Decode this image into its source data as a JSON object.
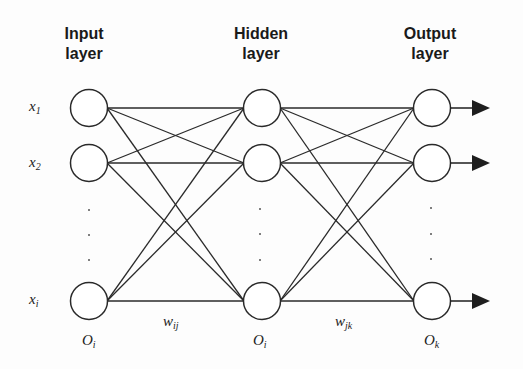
{
  "diagram": {
    "type": "feedforward-neural-network",
    "layers": [
      {
        "id": "input",
        "title_line1": "Input",
        "title_line2": "layer",
        "node_label": "O",
        "node_label_sub": "i",
        "inputs": [
          {
            "main": "x",
            "sub": "1"
          },
          {
            "main": "x",
            "sub": "2"
          },
          {
            "main": "x",
            "sub": "i"
          }
        ]
      },
      {
        "id": "hidden",
        "title_line1": "Hidden",
        "title_line2": "layer",
        "node_label": "O",
        "node_label_sub": "i"
      },
      {
        "id": "output",
        "title_line1": "Output",
        "title_line2": "layer",
        "node_label": "O",
        "node_label_sub": "k"
      }
    ],
    "weights": [
      {
        "main": "w",
        "sub": "ij"
      },
      {
        "main": "w",
        "sub": "jk"
      }
    ],
    "nodes_per_layer_visible": 3,
    "ellipsis": "⋮",
    "colors": {
      "stroke": "#2a2a2a",
      "background": "#fdfdfd",
      "arrow": "#1e1e1e"
    }
  }
}
